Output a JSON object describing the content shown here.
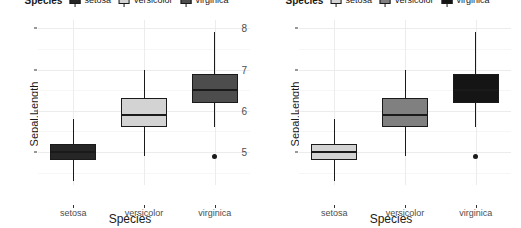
{
  "figure": {
    "width": 521,
    "height": 228,
    "background": "#ffffff",
    "panel_count": 2
  },
  "legend": {
    "title": "Species",
    "position": "top",
    "clipped": true,
    "items": [
      {
        "label": "setosa",
        "key": "boxplot-key"
      },
      {
        "label": "versicolor",
        "key": "boxplot-key"
      },
      {
        "label": "virginica",
        "key": "boxplot-key"
      }
    ]
  },
  "axes": {
    "ylabel": "Sepal.Length",
    "xlabel": "Species",
    "yticks": [
      "8",
      "7",
      "6",
      "5"
    ],
    "ytick_values": [
      8,
      7,
      6,
      5
    ],
    "ylim": [
      4.2,
      8.2
    ],
    "xticks": [
      "setosa",
      "versicolor",
      "virginica"
    ],
    "grid": "major-and-minor",
    "grid_color": "#ececec"
  },
  "chart_data": {
    "type": "boxplot",
    "title": "",
    "xlabel": "Species",
    "ylabel": "Sepal.Length",
    "ylim": [
      4.2,
      8.2
    ],
    "yticks": [
      5,
      6,
      7,
      8
    ],
    "categories": [
      "setosa",
      "versicolor",
      "virginica"
    ],
    "grid": true,
    "legend_position": "top",
    "panels": [
      {
        "name": "panel-left",
        "fill_scale": "grey-unordered",
        "boxes": [
          {
            "category": "setosa",
            "fill": "#262626",
            "min": 4.3,
            "q1": 4.8,
            "median": 5.0,
            "q3": 5.2,
            "max": 5.8,
            "outliers": []
          },
          {
            "category": "versicolor",
            "fill": "#d3d3d3",
            "min": 4.9,
            "q1": 5.6,
            "median": 5.9,
            "q3": 6.3,
            "max": 7.0,
            "outliers": []
          },
          {
            "category": "virginica",
            "fill": "#4d4d4d",
            "min": 5.6,
            "q1": 6.2,
            "median": 6.5,
            "q3": 6.9,
            "max": 7.9,
            "outliers": [
              4.9
            ]
          }
        ]
      },
      {
        "name": "panel-right",
        "fill_scale": "grey-ordered",
        "boxes": [
          {
            "category": "setosa",
            "fill": "#d3d3d3",
            "min": 4.3,
            "q1": 4.8,
            "median": 5.0,
            "q3": 5.2,
            "max": 5.8,
            "outliers": []
          },
          {
            "category": "versicolor",
            "fill": "#808080",
            "min": 4.9,
            "q1": 5.6,
            "median": 5.9,
            "q3": 6.3,
            "max": 7.0,
            "outliers": []
          },
          {
            "category": "virginica",
            "fill": "#151515",
            "min": 5.6,
            "q1": 6.2,
            "median": 6.5,
            "q3": 6.9,
            "max": 7.9,
            "outliers": [
              4.9
            ]
          }
        ]
      }
    ]
  }
}
